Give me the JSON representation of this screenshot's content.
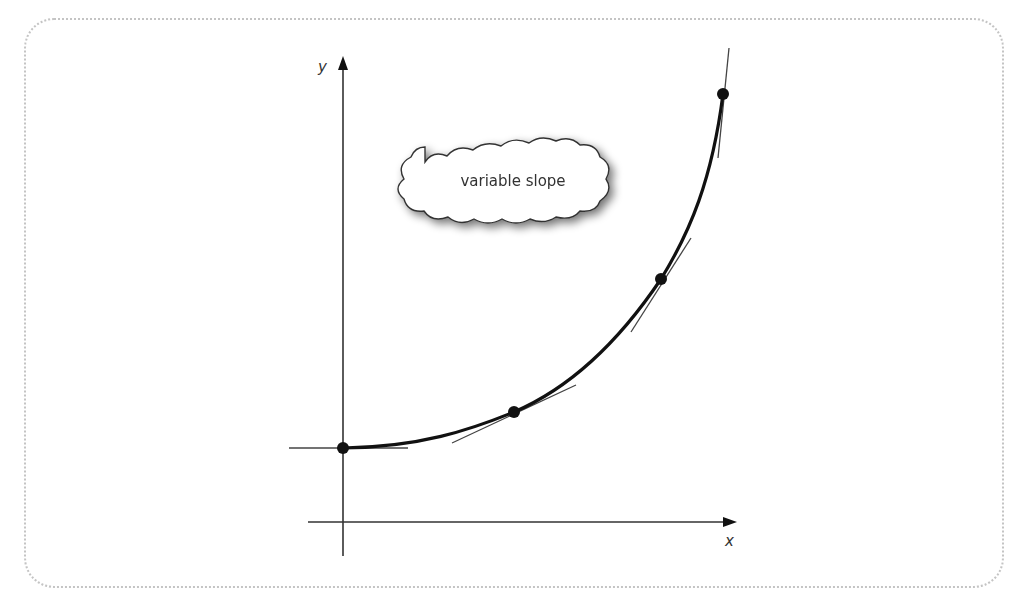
{
  "diagram": {
    "callout": {
      "text": "variable slope"
    },
    "axes": {
      "x_label": "x",
      "y_label": "y"
    },
    "curve": {
      "type": "exponential",
      "color": "#111111"
    },
    "points": [
      {
        "name": "y-intercept",
        "px": 343,
        "py": 448
      },
      {
        "name": "point-2",
        "px": 514,
        "py": 412
      },
      {
        "name": "point-3",
        "px": 661,
        "py": 279
      },
      {
        "name": "point-4",
        "px": 723,
        "py": 94
      }
    ],
    "tangents": [
      {
        "x1": 289,
        "y1": 448,
        "x2": 408,
        "y2": 448
      },
      {
        "x1": 452,
        "y1": 443,
        "x2": 576,
        "y2": 385
      },
      {
        "x1": 631,
        "y1": 332,
        "x2": 691,
        "y2": 238
      },
      {
        "x1": 718,
        "y1": 158,
        "x2": 729,
        "y2": 48
      }
    ],
    "colors": {
      "line": "#111111",
      "thin_line": "#444444",
      "frame_border": "#c4c4c4",
      "cloud_shadow": "#9a9a9a"
    }
  }
}
